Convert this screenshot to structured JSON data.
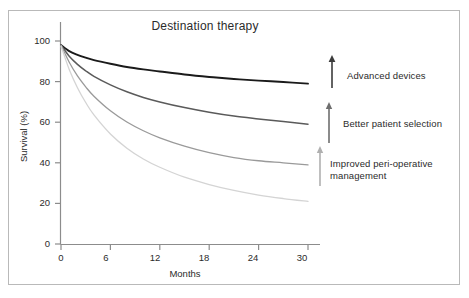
{
  "figure": {
    "title": "Destination therapy",
    "border_color": "#b9b9b9",
    "background": "#ffffff"
  },
  "chart_data": {
    "type": "line",
    "title": "Destination therapy",
    "xlabel": "Months",
    "ylabel": "Survival (%)",
    "xlim": [
      0,
      30
    ],
    "ylim": [
      0,
      100
    ],
    "grid": false,
    "legend_position": "right-annotations",
    "xticks": [
      0,
      6,
      12,
      18,
      24,
      30
    ],
    "yticks": [
      0,
      20,
      40,
      60,
      80,
      100
    ],
    "x": [
      0,
      1,
      2,
      3,
      4,
      6,
      8,
      10,
      12,
      15,
      18,
      21,
      24,
      27,
      30
    ],
    "series": [
      {
        "name": "Advanced devices curve",
        "color": "#1a1a1a",
        "values": [
          98,
          95,
          93.2,
          91.8,
          90.6,
          88.8,
          87.2,
          86.0,
          85.0,
          83.5,
          82.3,
          81.3,
          80.5,
          79.8,
          79.0
        ]
      },
      {
        "name": "Better patient selection curve",
        "color": "#5a5a5a",
        "values": [
          98,
          92.5,
          88.5,
          85.3,
          82.6,
          78.4,
          75.0,
          72.2,
          70.0,
          67.2,
          64.9,
          63.0,
          61.6,
          60.3,
          59.0
        ]
      },
      {
        "name": "Improved peri-operative management curve",
        "color": "#9a9a9a",
        "values": [
          98,
          89.5,
          82.8,
          77.4,
          72.8,
          65.6,
          60.1,
          55.8,
          52.3,
          48.2,
          45.0,
          42.6,
          41.0,
          40.0,
          39.0
        ]
      },
      {
        "name": "Baseline curve",
        "color": "#d4d4d4",
        "values": [
          97.5,
          86.0,
          77.0,
          69.7,
          63.6,
          54.2,
          47.2,
          41.9,
          37.8,
          32.9,
          29.3,
          26.4,
          24.1,
          22.4,
          21.0
        ]
      }
    ],
    "annotations": [
      {
        "id": "advanced-devices",
        "text": "Advanced devices",
        "arrow_color": "#3c3c3c",
        "arrow_from_y": 88,
        "arrow_to_y": 57
      },
      {
        "id": "better-patient-selection",
        "text": "Better patient selection",
        "arrow_color": "#6e6e6e",
        "arrow_from_y": 143,
        "arrow_to_y": 104
      },
      {
        "id": "improved-peri-operative-management",
        "text": "Improved peri-operative\nmanagement",
        "arrow_color": "#b0b0b0",
        "arrow_from_y": 185,
        "arrow_to_y": 148
      }
    ]
  },
  "axes": {
    "ylabel": "Survival (%)",
    "xlabel": "Months",
    "yticks": [
      "0",
      "20",
      "40",
      "60",
      "80",
      "100"
    ],
    "xticks": [
      "0",
      "6",
      "12",
      "18",
      "24",
      "30"
    ],
    "axis_color": "#8c8c8c"
  }
}
